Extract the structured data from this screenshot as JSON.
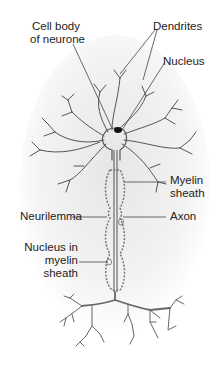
{
  "diagram": {
    "labels": {
      "cell_body_line1": "Cell body",
      "cell_body_line2": "of neurone",
      "dendrites": "Dendrites",
      "nucleus": "Nucleus",
      "myelin_line1": "Myelin",
      "myelin_line2": "sheath",
      "neurilemma": "Neurilemma",
      "axon": "Axon",
      "nucleus_myelin_line1": "Nucleus in",
      "nucleus_myelin_line2": "myelin",
      "nucleus_myelin_line3": "sheath"
    },
    "colors": {
      "line": "#555555",
      "label_text": "#222222",
      "shading": "#e8e8e8",
      "nucleus": "#111111"
    }
  }
}
